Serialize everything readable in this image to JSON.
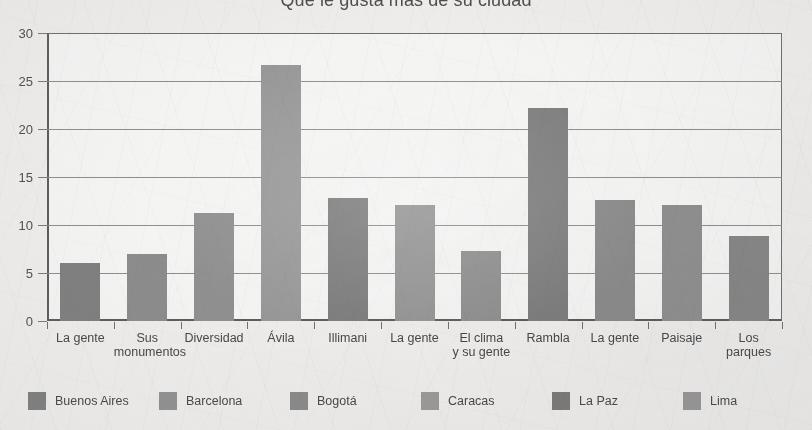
{
  "chart_data": {
    "type": "bar",
    "title": "Qué le gusta más de su ciudad",
    "xlabel": "",
    "ylabel": "",
    "ylim": [
      0,
      30
    ],
    "yticks": [
      0,
      5,
      10,
      15,
      20,
      25,
      30
    ],
    "ytick_labels": [
      "0",
      "5",
      "10",
      "15",
      "20",
      "25",
      "30"
    ],
    "grid": true,
    "legend_position": "bottom",
    "categories": [
      "La gente",
      "Sus\nmonumentos",
      "Diversidad",
      "Ávila",
      "Illimani",
      "La gente",
      "El clima\ny su gente",
      "Rambla",
      "La gente",
      "Paisaje",
      "Los\nparques"
    ],
    "values": [
      6.0,
      7.0,
      11.3,
      26.7,
      12.8,
      12.1,
      7.3,
      22.2,
      12.6,
      12.1,
      8.9
    ],
    "bar_series": [
      "Buenos Aires",
      "Buenos Aires",
      "Barcelona",
      "Caracas",
      "La Paz",
      "Lima",
      "Lima",
      "Barcelona",
      "Bogotá",
      "Bogotá",
      "La Paz"
    ],
    "bar_colors": [
      "#7f7f7f",
      "#8c8c8c",
      "#909090",
      "#989898",
      "#7c7c7c",
      "#949494",
      "#8e8e8e",
      "#7d7d7d",
      "#8b8b8b",
      "#8f8f8f",
      "#868686"
    ],
    "legend": [
      {
        "label": "Buenos Aires",
        "color": "#7f7f7f"
      },
      {
        "label": "Barcelona",
        "color": "#919191"
      },
      {
        "label": "Bogotá",
        "color": "#8a8a8a"
      },
      {
        "label": "Caracas",
        "color": "#9a9a9a"
      },
      {
        "label": "La Paz",
        "color": "#7a7a7a"
      },
      {
        "label": "Lima",
        "color": "#979797"
      }
    ]
  },
  "colors": {
    "background": "#eeedeb",
    "plot_background": "#faf9f8",
    "axis": "#5c5c5c",
    "gridline": "#8e8e8e",
    "text": "#474747",
    "title_text": "#4d4d4d"
  }
}
